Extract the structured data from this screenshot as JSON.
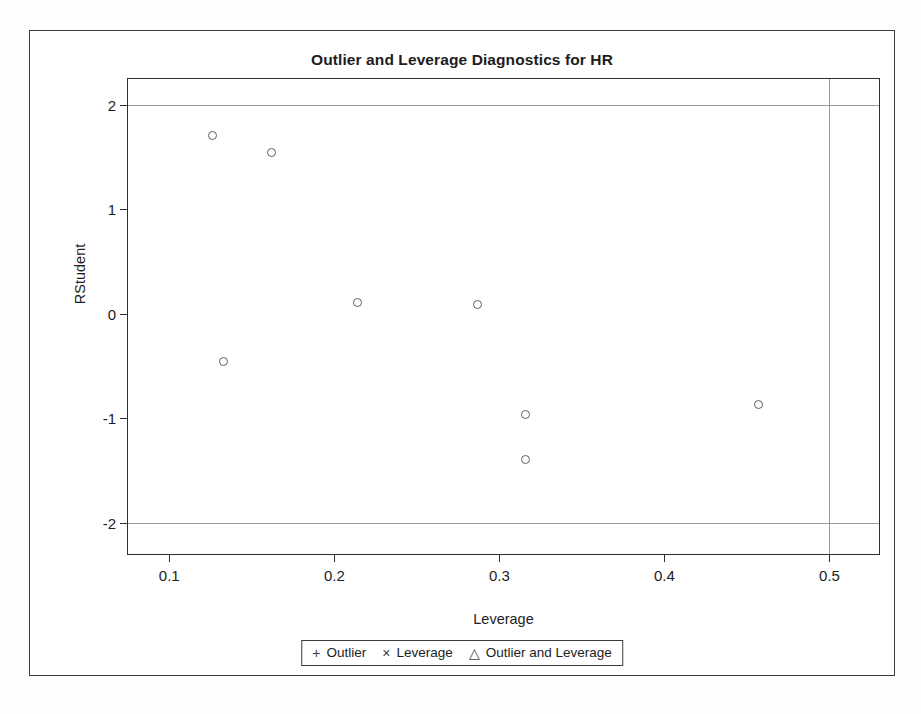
{
  "chart_data": {
    "type": "scatter",
    "title": "Outlier and Leverage Diagnostics for HR",
    "xlabel": "Leverage",
    "ylabel": "RStudent",
    "xlim": [
      0.075,
      0.53
    ],
    "ylim": [
      -2.3,
      2.25
    ],
    "xticks": [
      "0.1",
      "0.2",
      "0.3",
      "0.4",
      "0.5"
    ],
    "xtick_values": [
      0.1,
      0.2,
      0.3,
      0.4,
      0.5
    ],
    "yticks": [
      "2",
      "1",
      "0",
      "-1",
      "-2"
    ],
    "ytick_values": [
      2,
      1,
      0,
      -1,
      -2
    ],
    "grid": false,
    "reference_lines": {
      "horizontal": [
        2,
        -2
      ],
      "vertical": [
        0.5
      ]
    },
    "series": [
      {
        "name": "observations",
        "marker": "open-circle",
        "points": [
          {
            "x": 0.126,
            "y": 1.71
          },
          {
            "x": 0.162,
            "y": 1.55
          },
          {
            "x": 0.133,
            "y": -0.46
          },
          {
            "x": 0.214,
            "y": 0.11
          },
          {
            "x": 0.287,
            "y": 0.09
          },
          {
            "x": 0.316,
            "y": -0.96
          },
          {
            "x": 0.316,
            "y": -1.39
          },
          {
            "x": 0.457,
            "y": -0.87
          }
        ]
      }
    ],
    "legend": {
      "position": "bottom",
      "entries": [
        {
          "symbol": "+",
          "label": "Outlier"
        },
        {
          "symbol": "×",
          "label": "Leverage"
        },
        {
          "symbol": "△",
          "label": "Outlier and Leverage"
        }
      ]
    },
    "colors": {
      "marker_stroke": "#5b5f66",
      "axis": "#2e2e2e",
      "reference_line": "#9a9a9a",
      "text": "#1d1d1d",
      "background": "#ffffff"
    }
  }
}
